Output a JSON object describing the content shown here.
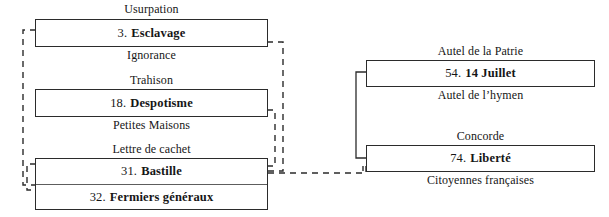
{
  "diagram": {
    "left_group": {
      "nodes": [
        {
          "caption_above": "Usurpation",
          "caption_below": "Ignorance",
          "rows": [
            {
              "number": "3.",
              "name": "Esclavage"
            }
          ]
        },
        {
          "caption_above": "Trahison",
          "caption_below": "Petites Maisons",
          "rows": [
            {
              "number": "18.",
              "name": "Despotisme"
            }
          ]
        },
        {
          "caption_above": "Lettre de cachet",
          "caption_below": "",
          "rows": [
            {
              "number": "31.",
              "name": "Bastille"
            },
            {
              "number": "32.",
              "name": "Fermiers généraux"
            }
          ]
        }
      ]
    },
    "right_group": {
      "nodes": [
        {
          "caption_above": "Autel de la Patrie",
          "caption_below": "Autel de l’hymen",
          "rows": [
            {
              "number": "54.",
              "name": "14 Juillet"
            }
          ]
        },
        {
          "caption_above": "Concorde",
          "caption_below": "Citoyennes françaises",
          "rows": [
            {
              "number": "74.",
              "name": "Liberté"
            }
          ]
        }
      ]
    },
    "colors": {
      "ink": "#161616",
      "box_border": "#2b2b2b",
      "row_divider": "#5d5d5d",
      "connector": "#2b2b2b",
      "background": "#ffffff"
    }
  }
}
